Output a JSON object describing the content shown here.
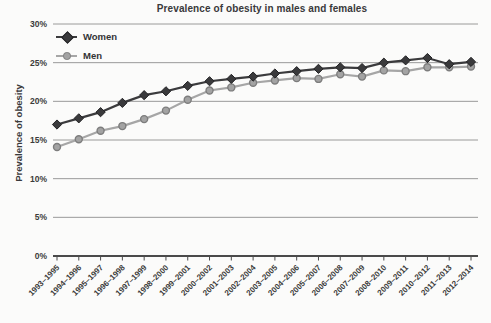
{
  "title": "Prevalence of obesity in males and females",
  "y_axis": {
    "label": "Prevalence of obesity"
  },
  "colors": {
    "background": "#fbfbfa",
    "grid": "#8f8f8f",
    "axis": "#4a4a4a",
    "text": "#3b3b3b",
    "women_line": "#3b3b3d",
    "women_marker_fill": "#3a3a3c",
    "women_marker_stroke": "#232325",
    "men_line": "#a6a6a6",
    "men_marker_fill": "#a3a3a3",
    "men_marker_stroke": "#7d7d7d"
  },
  "chart_data": {
    "type": "line",
    "title": "Prevalence of obesity in males and females",
    "xlabel": "",
    "ylabel": "Prevalence of obesity",
    "ylim": [
      0,
      30
    ],
    "grid": true,
    "legend_position": "top-left-inside",
    "y_ticks": [
      "0%",
      "5%",
      "10%",
      "15%",
      "20%",
      "25%",
      "30%"
    ],
    "categories": [
      "1993–1995",
      "1994–1996",
      "1995–1997",
      "1996–1998",
      "1997–1999",
      "1998–2000",
      "1999–2001",
      "2000–2002",
      "2001–2003",
      "2002–2004",
      "2003–2005",
      "2004–2006",
      "2005–2007",
      "2006–2008",
      "2007–2009",
      "2008–2010",
      "2009–2011",
      "2010–2012",
      "2011–2013",
      "2012–2014"
    ],
    "series": [
      {
        "name": "Women",
        "marker": "diamond",
        "color": "#3b3b3d",
        "marker_fill": "#3a3a3c",
        "marker_stroke": "#232325",
        "values": [
          17.0,
          17.8,
          18.6,
          19.8,
          20.8,
          21.3,
          22.0,
          22.6,
          22.9,
          23.2,
          23.6,
          23.9,
          24.2,
          24.4,
          24.3,
          25.0,
          25.3,
          25.6,
          24.8,
          25.1
        ]
      },
      {
        "name": "Men",
        "marker": "circle",
        "color": "#a6a6a6",
        "marker_fill": "#a3a3a3",
        "marker_stroke": "#7d7d7d",
        "values": [
          14.1,
          15.1,
          16.2,
          16.8,
          17.7,
          18.8,
          20.2,
          21.4,
          21.8,
          22.4,
          22.7,
          23.0,
          22.9,
          23.5,
          23.2,
          24.0,
          23.9,
          24.4,
          24.4,
          24.5
        ]
      }
    ]
  }
}
